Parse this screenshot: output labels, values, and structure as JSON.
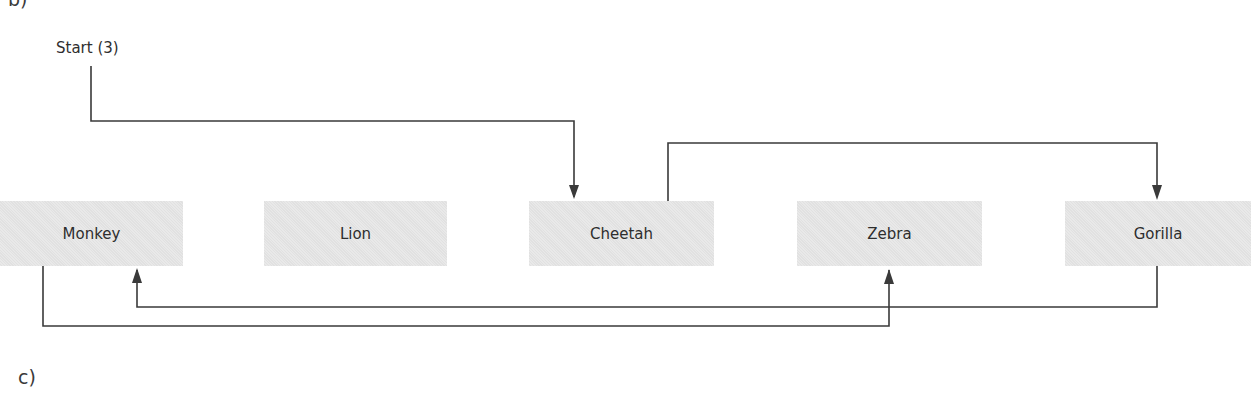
{
  "diagram": {
    "section_label_top": "b)",
    "section_label_bottom": "c)",
    "start_label": "Start (3)",
    "nodes": [
      {
        "label": "Monkey"
      },
      {
        "label": "Lion"
      },
      {
        "label": "Cheetah"
      },
      {
        "label": "Zebra"
      },
      {
        "label": "Gorilla"
      }
    ],
    "edges": [
      {
        "from": "Start (3)",
        "to": "Cheetah"
      },
      {
        "from": "Cheetah",
        "to": "Gorilla"
      },
      {
        "from": "Gorilla",
        "to": "Monkey"
      },
      {
        "from": "Monkey",
        "to": "Zebra"
      }
    ],
    "colors": {
      "node_fill": "#e6e6e6",
      "line": "#3a3a3a",
      "text": "#2e2e2e"
    }
  }
}
